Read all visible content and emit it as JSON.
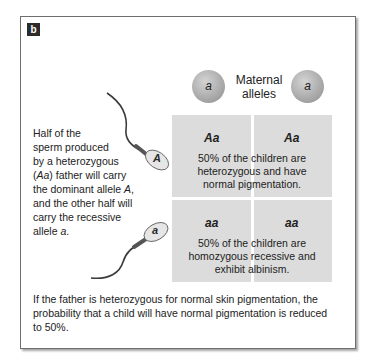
{
  "panel": {
    "label": "b"
  },
  "maternal": {
    "title": "Maternal alleles",
    "title_line1": "Maternal",
    "title_line2": "alleles",
    "alleles": [
      "a",
      "a"
    ]
  },
  "paternal": {
    "description_parts": {
      "l1": "Half of the",
      "l2": "sperm produced",
      "l3": "by a heterozygous",
      "l4a": "(",
      "l4b": "Aa",
      "l4c": ") father will carry",
      "l5a": "the dominant allele ",
      "l5b": "A",
      "l5c": ",",
      "l6": "and the other half will",
      "l7": "carry the recessive",
      "l8a": "allele ",
      "l8b": "a",
      "l8c": "."
    },
    "sperm": [
      {
        "allele": "A"
      },
      {
        "allele": "a"
      }
    ]
  },
  "punnett": {
    "rows": [
      {
        "genotypes": [
          "Aa",
          "Aa"
        ],
        "note_lines": [
          "50% of the children are",
          "heterozygous and have",
          "normal pigmentation."
        ]
      },
      {
        "genotypes": [
          "aa",
          "aa"
        ],
        "note_lines": [
          "50% of the children are",
          "homozygous recessive and",
          "exhibit albinism."
        ]
      }
    ],
    "cell_color": "#dcdcdc"
  },
  "caption": {
    "line1": "If the father is heterozygous for normal skin pigmentation, the",
    "line2": "probability that a child will have normal pigmentation is reduced",
    "line3": "to 50%."
  }
}
